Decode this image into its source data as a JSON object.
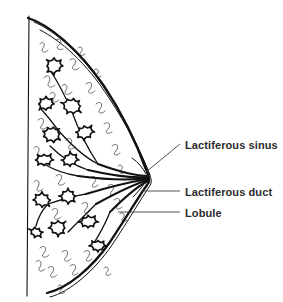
{
  "figure": {
    "background_color": "#ffffff",
    "line_color": "#111111",
    "text_color": "#2b2b2b",
    "width": 283,
    "height": 302
  },
  "labels": [
    {
      "id": "lactiferous-sinus",
      "text": "Lactiferous sinus",
      "text_x": 185,
      "text_y": 146,
      "leader": "M 180 144 L 146 172"
    },
    {
      "id": "lactiferous-duct",
      "text": "Lactiferous duct",
      "text_x": 185,
      "text_y": 193,
      "leader": "M 180 191 L 141 191"
    },
    {
      "id": "lobule",
      "text": "Lobule",
      "text_x": 185,
      "text_y": 214,
      "leader": "M 180 212 L 118 212"
    }
  ],
  "anatomy": {
    "chest_wall": "M 29 16 L 27 296",
    "skin_outline": "M 28 18 C 48 24, 78 48, 104 86 C 124 116, 139 150, 147 172 C 150 179, 150 182, 147 185 C 139 196, 126 218, 110 242 C 92 268, 68 288, 47 293",
    "skin_inner": "M 34 22 C 54 30, 82 54, 107 92 C 126 120, 141 152, 149 173 C 152 180, 152 183, 149 187 C 141 199, 128 221, 112 245 C 95 270, 70 292, 50 297",
    "subcutaneous": "M 40 30 C 60 40, 86 62, 109 98 C 127 125, 142 155, 150 175",
    "areola_fold_top": "M 132 158 C 138 162, 143 168, 146 174",
    "areola_fold_bottom": "M 133 197 C 138 192, 143 186, 146 181",
    "nipple_ducts": [
      "M 148 176 C 138 176, 120 172, 98 164",
      "M 148 177 C 136 178, 114 176, 88 170",
      "M 148 178 C 134 180, 108 180, 78 176",
      "M 148 179 C 136 181, 112 186, 86 194",
      "M 148 180 C 138 183, 118 192, 96 204",
      "M 148 181 C 140 185, 126 196, 110 212"
    ],
    "ducts": [
      "M 98 164 C 86 158, 72 146, 58 130",
      "M 98 164 C 90 152, 80 134, 72 112",
      "M 88 170 C 76 166, 62 158, 50 146",
      "M 78 176 C 66 174, 54 170, 44 164",
      "M 86 194 C 74 196, 60 200, 48 204",
      "M 96 204 C 88 212, 78 222, 68 232",
      "M 110 212 C 106 222, 100 234, 92 246",
      "M 72 112 C 66 98, 58 82, 50 70",
      "M 58 130 C 52 122, 46 114, 40 108",
      "M 48 204 C 42 210, 38 218, 36 226"
    ],
    "lobules": [
      {
        "cx": 54,
        "cy": 66,
        "r": 9,
        "n": 8,
        "seed": 1
      },
      {
        "cx": 46,
        "cy": 104,
        "r": 9,
        "n": 8,
        "seed": 2
      },
      {
        "cx": 72,
        "cy": 106,
        "r": 10,
        "n": 9,
        "seed": 3
      },
      {
        "cx": 52,
        "cy": 134,
        "r": 10,
        "n": 9,
        "seed": 4
      },
      {
        "cx": 84,
        "cy": 132,
        "r": 9,
        "n": 8,
        "seed": 5
      },
      {
        "cx": 44,
        "cy": 160,
        "r": 9,
        "n": 8,
        "seed": 6
      },
      {
        "cx": 70,
        "cy": 160,
        "r": 9,
        "n": 8,
        "seed": 7
      },
      {
        "cx": 42,
        "cy": 200,
        "r": 9,
        "n": 8,
        "seed": 8
      },
      {
        "cx": 68,
        "cy": 196,
        "r": 9,
        "n": 8,
        "seed": 9
      },
      {
        "cx": 58,
        "cy": 228,
        "r": 9,
        "n": 8,
        "seed": 10
      },
      {
        "cx": 88,
        "cy": 222,
        "r": 9,
        "n": 8,
        "seed": 11
      },
      {
        "cx": 98,
        "cy": 246,
        "r": 8,
        "n": 8,
        "seed": 12
      },
      {
        "cx": 36,
        "cy": 232,
        "r": 7,
        "n": 7,
        "seed": 13
      }
    ],
    "tissue_squiggles": [
      "M 40 44 c 3 -4 6 0 3 4 c -3 4 2 6 5 2",
      "M 56 40 c 4 -3 7 2 3 5 c -4 3 0 6 4 4",
      "M 70 60 c 4 -4 8 1 4 5 c -4 4 1 7 5 3",
      "M 44 78 c 3 -5 8 -1 5 4 c -3 5 2 7 6 3",
      "M 86 84 c 4 -4 8 0 4 5 c -4 4 1 6 5 2",
      "M 62 86 c 3 -4 7 0 4 4 c -3 5 2 6 6 2",
      "M 96 104 c 4 -4 8 0 4 5 c -3 4 1 6 5 2",
      "M 38 120 c 4 -4 8 0 4 5 c -4 4 1 6 5 2",
      "M 104 124 c 4 -4 8 1 4 5 c -4 4 0 6 4 3",
      "M 66 140 c 4 -4 8 0 4 5 c -4 4 1 6 5 2",
      "M 34 148 c 3 -4 7 0 4 5 c -3 4 1 6 5 2",
      "M 112 146 c 4 -4 8 0 4 5 c -4 4 0 6 4 2",
      "M 56 176 c 4 -4 8 0 4 5 c -4 4 1 6 5 2",
      "M 34 182 c 3 -4 7 0 4 5 c -3 4 1 6 5 2",
      "M 90 178 c 4 -4 8 0 4 5 c -4 4 0 6 4 2",
      "M 108 186 c 4 -4 8 0 4 5 c -4 4 0 6 4 2",
      "M 52 210 c 4 -4 8 0 4 5 c -4 4 1 6 5 2",
      "M 82 204 c 4 -4 8 0 4 5 c -4 4 0 6 4 2",
      "M 114 200 c 4 -4 8 0 4 5 c -4 4 0 6 4 2",
      "M 40 248 c 4 -4 8 0 4 5 c -4 4 1 6 5 2",
      "M 62 252 c 4 -4 8 0 4 5 c -4 4 1 6 5 2",
      "M 84 252 c 4 -4 8 0 4 5 c -4 4 0 6 4 2",
      "M 48 268 c 4 -4 8 0 4 5 c -4 4 1 6 5 2",
      "M 70 266 c 4 -4 8 0 4 5 c -4 4 0 6 4 2",
      "M 36 262 c 3 -4 7 0 4 5 c -3 4 1 6 5 2",
      "M 50 94 c 3 -4 7 0 4 4 c -3 4 1 6 5 2",
      "M 78 48 c 3 -3 6 1 3 4 c -3 3 1 5 4 2",
      "M 94 70 c 3 -3 6 1 3 4 c -3 3 1 5 4 2",
      "M 118 166 c 3 -3 6 1 3 4 c -3 3 1 5 4 2",
      "M 120 214 c 3 -3 6 1 3 4 c -3 3 1 5 4 2",
      "M 104 268 c 3 -3 6 1 3 4 c -3 3 1 5 4 2",
      "M 58 286 c 3 -3 6 1 3 4 c -3 3 1 5 4 2"
    ]
  }
}
